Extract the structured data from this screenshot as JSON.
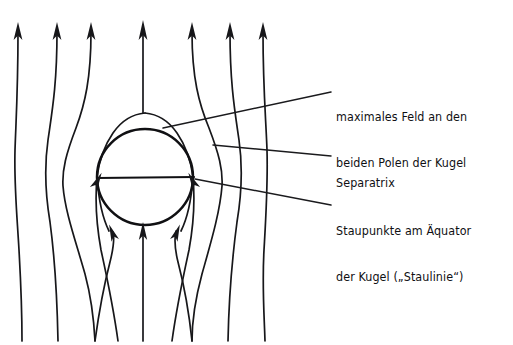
{
  "figure": {
    "ink_color": "#17171a",
    "background_color": "#ffffff"
  },
  "annotations": [
    {
      "id": "maximales-feld",
      "line1": "maximales Feld an den",
      "line2": "beiden Polen der Kugel"
    },
    {
      "id": "separatrix",
      "line1": "Separatrix",
      "line2": ""
    },
    {
      "id": "staupunkte",
      "line1": "Staupunkte am Äquator",
      "line2": "der Kugel („Staulinie“)"
    }
  ],
  "diagram": {
    "sphere": {
      "cx": 145,
      "cy": 177,
      "r": 48
    },
    "equator": {
      "x1": 97,
      "y1": 178,
      "x2": 194,
      "y2": 177
    },
    "flow_line_count": 7,
    "top_arrow_count": 7,
    "stagnation_points": [
      {
        "label": "left",
        "x": 97,
        "y": 178
      },
      {
        "label": "right",
        "x": 193,
        "y": 177
      }
    ],
    "leader_lines": [
      {
        "from_x": 163,
        "from_y": 128,
        "to_x": 331,
        "to_y": 92
      },
      {
        "from_x": 213,
        "from_y": 145,
        "to_x": 331,
        "to_y": 156
      },
      {
        "from_x": 195,
        "from_y": 179,
        "to_x": 331,
        "to_y": 205
      }
    ]
  }
}
